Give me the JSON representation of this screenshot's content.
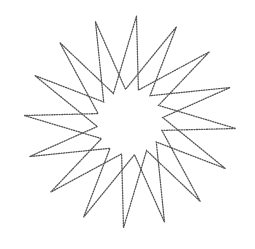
{
  "diagram": {
    "type": "star-polygon",
    "center": [
      130,
      122
    ],
    "outer_radius": 106,
    "inner_radius": 33,
    "points": 16,
    "start_angle_deg": -109,
    "valley_offset_deg": 11.25,
    "line_style": "dotted",
    "stroke_color": "#555555",
    "background_color": "#ffffff"
  }
}
